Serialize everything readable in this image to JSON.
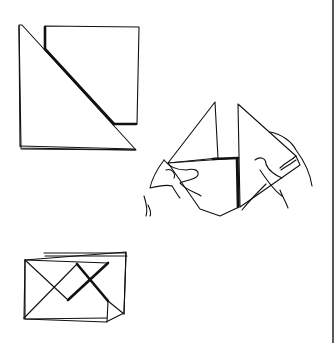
{
  "illustration": {
    "subject": "paper folding steps",
    "line_color": "#111111",
    "background": "#ffffff",
    "steps": [
      {
        "id": "step-1",
        "description": "square sheet folded diagonally into a triangle"
      },
      {
        "id": "step-2",
        "description": "two hands holding folded triangles"
      },
      {
        "id": "step-3",
        "description": "square with diagonal crossed folds"
      }
    ]
  }
}
